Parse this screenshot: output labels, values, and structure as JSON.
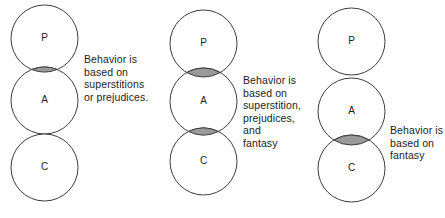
{
  "figure": {
    "type": "venn-diagram-set",
    "stroke_color": "#3c3c3c",
    "fill_color": "#ffffff",
    "lens_fill_color": "#9a9a9a",
    "text_color": "#1c1c1c",
    "background_color": "#ffffff"
  },
  "diagrams": [
    {
      "id": "diagram-1",
      "circles": [
        {
          "label": "P",
          "cx": 44.5,
          "cy": 38.5,
          "r": 33.5
        },
        {
          "label": "A",
          "cx": 44.5,
          "cy": 100.5,
          "r": 33.5
        },
        {
          "label": "C",
          "cx": 44.5,
          "cy": 167.5,
          "r": 33.5
        }
      ],
      "overlaps": [
        {
          "top": "P",
          "bottom": "A",
          "shaded": true
        },
        {
          "top": "A",
          "bottom": "C",
          "shaded": false
        }
      ],
      "caption": "Behavior is\nbased on\nsuperstitions\nor prejudices."
    },
    {
      "id": "diagram-2",
      "circles": [
        {
          "label": "P",
          "cx": 203.5,
          "cy": 43.5,
          "r": 33.5
        },
        {
          "label": "A",
          "cx": 203.5,
          "cy": 101.5,
          "r": 33.5
        },
        {
          "label": "C",
          "cx": 203.5,
          "cy": 161.5,
          "r": 33.5
        }
      ],
      "overlaps": [
        {
          "top": "P",
          "bottom": "A",
          "shaded": true
        },
        {
          "top": "A",
          "bottom": "C",
          "shaded": true
        }
      ],
      "caption": "Behavior is\nbased on\nsuperstition,\nprejudices,\nand\nfantasy"
    },
    {
      "id": "diagram-3",
      "circles": [
        {
          "label": "P",
          "cx": 351.5,
          "cy": 41.5,
          "r": 33.5
        },
        {
          "label": "A",
          "cx": 351.5,
          "cy": 111.5,
          "r": 33.5
        },
        {
          "label": "C",
          "cx": 351.5,
          "cy": 168.5,
          "r": 33.5
        }
      ],
      "overlaps": [
        {
          "top": "P",
          "bottom": "A",
          "shaded": false
        },
        {
          "top": "A",
          "bottom": "C",
          "shaded": true
        }
      ],
      "caption": "Behavior is\nbased on\nfantasy"
    }
  ]
}
